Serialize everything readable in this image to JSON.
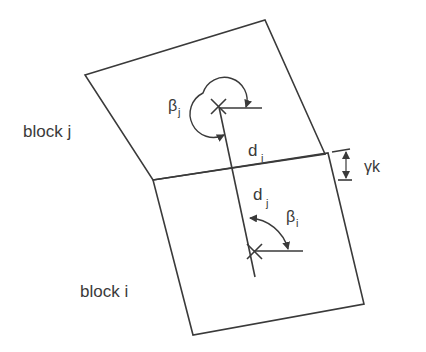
{
  "diagram": {
    "type": "block interaction schematic",
    "colors": {
      "stroke": "#3a3a3a",
      "background": "#ffffff"
    },
    "blocks": [
      {
        "id": "block_j",
        "label": "block j"
      },
      {
        "id": "block_i",
        "label": "block i"
      }
    ],
    "labels": {
      "block_j": "block j",
      "block_i": "block i",
      "beta": "β",
      "beta_j_sub": "j",
      "beta_i_sub": "i",
      "d": "d",
      "d_i_sub": "i",
      "d_j_sub": "j",
      "gamma_k": "γk"
    },
    "annotations": [
      {
        "symbol": "βj",
        "meaning": "angle at centroid of block j"
      },
      {
        "symbol": "βi",
        "meaning": "angle at centroid of block i"
      },
      {
        "symbol": "di",
        "meaning": "distance from block j centroid to joint"
      },
      {
        "symbol": "dj",
        "meaning": "distance from joint to block i centroid"
      },
      {
        "symbol": "γk",
        "meaning": "offset dimension at joint"
      }
    ],
    "markers": [
      {
        "name": "centroid-j",
        "shape": "x"
      },
      {
        "name": "centroid-i",
        "shape": "x"
      }
    ]
  }
}
